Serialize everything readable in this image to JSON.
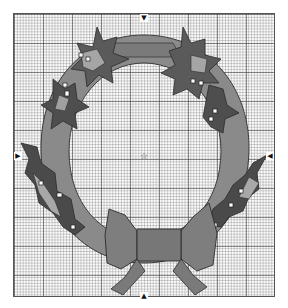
{
  "pattern": {
    "subject": "Holly wreath with bow",
    "grid": {
      "style": "cross-stitch chart",
      "minor_cell_px": 2.9,
      "major_every": 10
    },
    "colors": {
      "wreath_base": "#8a8a8a",
      "leaf_dark": "#4a4a4a",
      "leaf_mid": "#6a6a6a",
      "leaf_light": "#a9a9a9",
      "bow": "#7e7e7e",
      "bow_knot": "#777777",
      "berry": "#ffffff",
      "outline": "#2b2b2b"
    },
    "markers": {
      "top": "▼",
      "bottom": "▲",
      "left": "▶",
      "right": "◀",
      "center": "☆"
    }
  }
}
